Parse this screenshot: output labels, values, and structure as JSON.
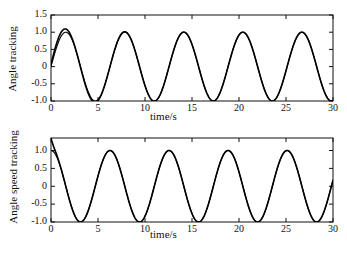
{
  "figure": {
    "background": "#ffffff",
    "line_color": "#000000",
    "axis_color": "#111111"
  },
  "chart_data": [
    {
      "id": "angle-tracking",
      "type": "line",
      "title": "",
      "xlabel": "time/s",
      "ylabel": "Angle tracking",
      "xlim": [
        0,
        30
      ],
      "ylim": [
        -1.0,
        1.5
      ],
      "xticks": [
        0,
        5,
        10,
        15,
        20,
        25,
        30
      ],
      "xticklabels": [
        "0",
        "5",
        "10",
        "15",
        "20",
        "25",
        "30"
      ],
      "yticks": [
        -1.0,
        -0.5,
        0,
        0.5,
        1.0,
        1.5
      ],
      "yticklabels": [
        "-1.0",
        "-0.5",
        "0",
        "0.5",
        "1.0",
        "1.5"
      ],
      "grid": false,
      "legend": "none",
      "series": [
        {
          "name": "reference",
          "description": "reference sine, amplitude 1.0, period 6.28 s, starts at 0 rising",
          "amplitude": 1.0,
          "period": 6.28,
          "phase": 0.0,
          "offset": 0.0,
          "peaks_t": [
            1.6,
            7.9,
            14.1,
            20.4,
            26.7
          ],
          "peaks_y": [
            1.0,
            1.0,
            1.0,
            1.0,
            1.0
          ],
          "troughs_t": [
            4.7,
            11.0,
            17.3,
            23.6,
            29.8
          ],
          "troughs_y": [
            -1.0,
            -1.0,
            -1.0,
            -1.0,
            -1.0
          ]
        },
        {
          "name": "tracked",
          "description": "tracked output, initial overshoot to 1.15 then converges onto reference",
          "amplitude": 1.0,
          "period": 6.28,
          "phase": 0.0,
          "offset": 0.0,
          "initial_overshoot_peak_t": 1.7,
          "initial_overshoot_peak_y": 1.15,
          "initial_undershoot_t": 4.8,
          "initial_undershoot_y": -1.07,
          "settling_time_s": 8.0
        }
      ]
    },
    {
      "id": "angle-speed-tracking",
      "type": "line",
      "title": "",
      "xlabel": "time/s",
      "ylabel": "Angle speed tracking",
      "xlim": [
        0,
        30
      ],
      "ylim": [
        -1.0,
        1.35
      ],
      "xticks": [
        0,
        5,
        10,
        15,
        20,
        25,
        30
      ],
      "xticklabels": [
        "0",
        "5",
        "10",
        "15",
        "20",
        "25",
        "30"
      ],
      "yticks": [
        -1.0,
        -0.5,
        0,
        0.5,
        1.0
      ],
      "yticklabels": [
        "-1.0",
        "-0.5",
        "0",
        "0.5",
        "1.0"
      ],
      "grid": false,
      "legend": "none",
      "series": [
        {
          "name": "reference",
          "description": "reference cosine, amplitude 1.0, period 6.28 s, starts at maximum",
          "amplitude": 1.0,
          "period": 6.28,
          "phase": 1.5708,
          "offset": 0.0,
          "peaks_t": [
            0.0,
            6.3,
            12.6,
            18.8,
            25.1
          ],
          "peaks_y": [
            1.0,
            1.0,
            1.0,
            1.0,
            1.0
          ],
          "troughs_t": [
            3.1,
            9.4,
            15.7,
            22.0,
            28.3
          ],
          "troughs_y": [
            -1.0,
            -1.0,
            -1.0,
            -1.0,
            -1.0
          ]
        },
        {
          "name": "tracked",
          "description": "tracked speed, initial spike to 1.35 at t=0 then follows reference",
          "amplitude": 1.0,
          "period": 6.28,
          "phase": 1.5708,
          "offset": 0.0,
          "initial_spike_t": 0.0,
          "initial_spike_y": 1.35,
          "settling_time_s": 1.0
        }
      ]
    }
  ]
}
